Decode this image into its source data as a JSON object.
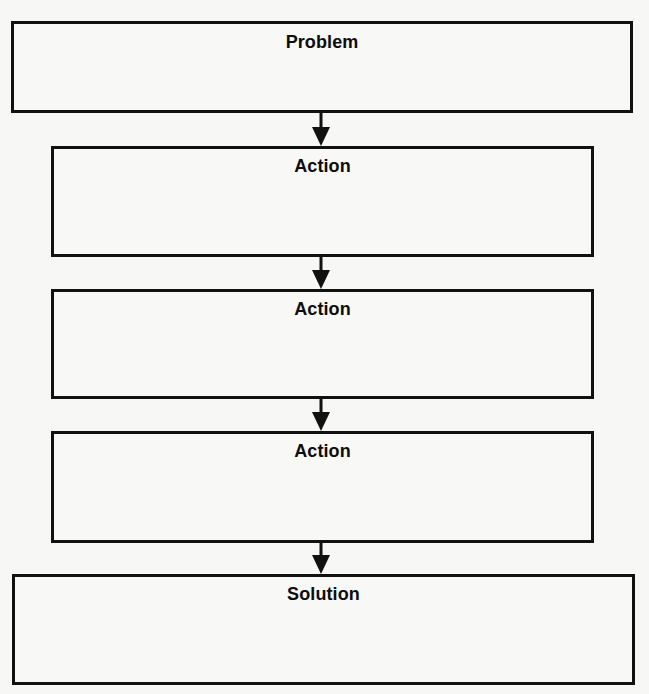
{
  "diagram": {
    "type": "flowchart",
    "direction": "top-to-bottom",
    "colors": {
      "background": "#f7f7f6",
      "stroke": "#111111",
      "text": "#0d0d0d"
    },
    "nodes": [
      {
        "id": "problem",
        "label": "Problem",
        "body": ""
      },
      {
        "id": "action-1",
        "label": "Action",
        "body": ""
      },
      {
        "id": "action-2",
        "label": "Action",
        "body": ""
      },
      {
        "id": "action-3",
        "label": "Action",
        "body": ""
      },
      {
        "id": "solution",
        "label": "Solution",
        "body": ""
      }
    ],
    "edges": [
      {
        "from": "problem",
        "to": "action-1",
        "icon": "arrow-down-icon"
      },
      {
        "from": "action-1",
        "to": "action-2",
        "icon": "arrow-down-icon"
      },
      {
        "from": "action-2",
        "to": "action-3",
        "icon": "arrow-down-icon"
      },
      {
        "from": "action-3",
        "to": "solution",
        "icon": "arrow-down-icon"
      }
    ]
  }
}
